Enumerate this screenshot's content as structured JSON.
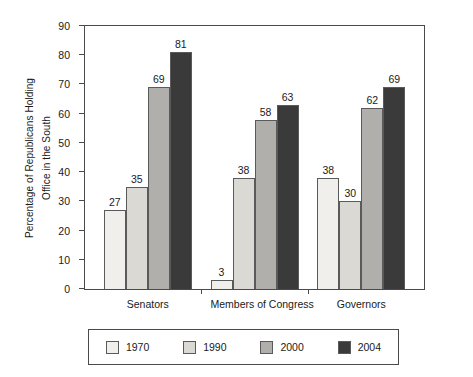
{
  "chart_data": {
    "type": "bar",
    "title": "",
    "xlabel": "",
    "ylabel_line1": "Percentage of Republicans Holding",
    "ylabel_line2": "Office in the South",
    "ylim": [
      0,
      90
    ],
    "ytick_step": 10,
    "yticks": [
      "0",
      "10",
      "20",
      "30",
      "40",
      "50",
      "60",
      "70",
      "80",
      "90"
    ],
    "grid": false,
    "legend_position": "bottom",
    "categories": [
      "Senators",
      "Members of Congress",
      "Governors"
    ],
    "series": [
      {
        "name": "1970",
        "color": "#f0efeb",
        "values": [
          27,
          3,
          38
        ]
      },
      {
        "name": "1990",
        "color": "#dbd9d4",
        "values": [
          35,
          38,
          30
        ]
      },
      {
        "name": "2000",
        "color": "#b1afab",
        "values": [
          69,
          58,
          62
        ]
      },
      {
        "name": "2004",
        "color": "#3a3a3a",
        "values": [
          81,
          63,
          69
        ]
      }
    ]
  }
}
